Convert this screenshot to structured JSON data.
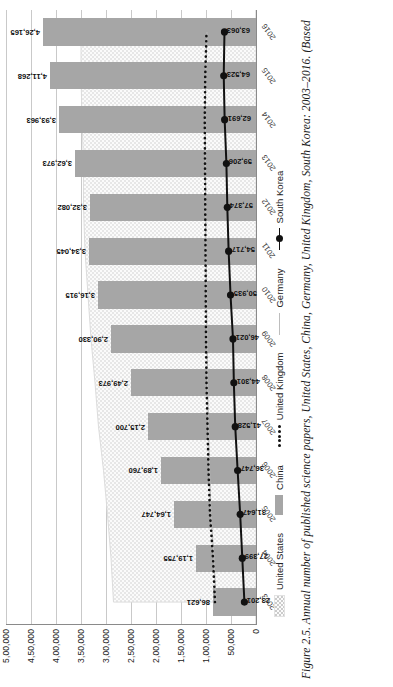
{
  "figure": {
    "caption": "Figure 2.5. Annual number of published science papers, United States, China, Germany, United Kingdom, South Korea: 2003–2016. (Based"
  },
  "legend": {
    "items": [
      {
        "label": "United States",
        "marker": "area-swatch-icon"
      },
      {
        "label": "China",
        "marker": "bar-swatch-icon"
      },
      {
        "label": "United Kingdom",
        "marker": "dotted-line-icon"
      },
      {
        "label": "Germany",
        "marker": "thin-line-icon"
      },
      {
        "label": "South Korea",
        "marker": "line-marker-icon"
      }
    ]
  },
  "axis": {
    "y_ticks": [
      "0",
      "50,000",
      "1,00,000",
      "1,50,000",
      "2,00,000",
      "2,50,000",
      "3,00,000",
      "3,50,000",
      "4,00,000",
      "4,50,000",
      "5,00,000"
    ]
  },
  "chart_data": {
    "type": "bar",
    "title": "Annual number of published science papers",
    "xlabel": "",
    "ylabel": "",
    "ylim": [
      0,
      500000
    ],
    "grid": true,
    "legend_position": "bottom",
    "categories": [
      "2003",
      "2004",
      "2005",
      "2006",
      "2007",
      "2008",
      "2009",
      "2010",
      "2011",
      "2012",
      "2013",
      "2014",
      "2015",
      "2016"
    ],
    "series": [
      {
        "name": "United States",
        "type": "area",
        "values": [
          285000,
          290000,
          297000,
          305000,
          315000,
          322000,
          330000,
          336000,
          342000,
          345000,
          345000,
          348000,
          350000,
          350000
        ],
        "labels": []
      },
      {
        "name": "China",
        "type": "bar",
        "values": [
          86621,
          119755,
          164747,
          189760,
          215700,
          249973,
          290330,
          316915,
          334045,
          332082,
          362973,
          393963,
          411268,
          426165
        ],
        "labels": [
          "86,621",
          "1,19,755",
          "1,64,747",
          "1,89,760",
          "2,15,700",
          "2,49,973",
          "2,90,330",
          "3,16,915",
          "3,34,045",
          "3,32,082",
          "3,62,973",
          "3,93,963",
          "4,11,268",
          "4,26,165"
        ]
      },
      {
        "name": "United Kingdom",
        "type": "dotted-line",
        "values": [
          82000,
          86000,
          92000,
          95000,
          97000,
          99000,
          100000,
          100500,
          101000,
          101500,
          102000,
          102500,
          101500,
          99000
        ],
        "labels": []
      },
      {
        "name": "Germany",
        "type": "line",
        "values": [
          80000,
          84000,
          90000,
          93000,
          95000,
          97000,
          98000,
          99000,
          100000,
          100500,
          101000,
          101500,
          100500,
          98000
        ],
        "labels": []
      },
      {
        "name": "South Korea",
        "type": "line-marker",
        "values": [
          23201,
          27399,
          31647,
          36747,
          41528,
          44301,
          46021,
          50935,
          54717,
          57374,
          59206,
          62691,
          64523,
          63063
        ],
        "labels": [
          "23,201",
          "27,399",
          "31,647",
          "36,747",
          "41,528",
          "44,301",
          "46,021",
          "50,935",
          "54,717",
          "57,374",
          "59,206",
          "62,691",
          "64,523",
          "63,063"
        ]
      }
    ]
  }
}
